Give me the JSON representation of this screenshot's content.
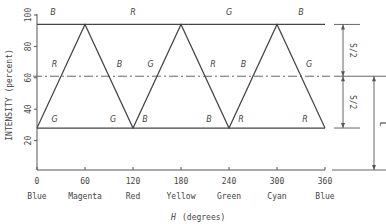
{
  "chart_data": {
    "type": "line",
    "title": "",
    "xlabel_symbol": "H",
    "xlabel": "(degrees)",
    "ylabel": "INTENSITY (percent)",
    "xlim": [
      0,
      360
    ],
    "ylim": [
      0,
      100
    ],
    "x_ticks": [
      0,
      60,
      120,
      180,
      240,
      300,
      360
    ],
    "y_ticks": [
      20,
      40,
      60,
      80,
      100
    ],
    "x_tick_names": [
      "Blue",
      "Magenta",
      "Red",
      "Yellow",
      "Green",
      "Cyan",
      "Blue"
    ],
    "grid": false,
    "legend": "none (curves labeled inline with R, G, B)",
    "levels": {
      "max": 94,
      "mid": 61,
      "min": 28
    },
    "series": [
      {
        "name": "R",
        "x": [
          0,
          60,
          180,
          240,
          360
        ],
        "y": [
          28,
          94,
          94,
          28,
          28
        ]
      },
      {
        "name": "G",
        "x": [
          0,
          120,
          180,
          300,
          360
        ],
        "y": [
          28,
          28,
          94,
          94,
          28
        ]
      },
      {
        "name": "B",
        "x": [
          0,
          60,
          120,
          240,
          300,
          360
        ],
        "y": [
          94,
          94,
          28,
          28,
          94,
          94
        ]
      }
    ],
    "inline_curve_labels": [
      {
        "text": "B",
        "x": 20,
        "y": 100
      },
      {
        "text": "R",
        "x": 120,
        "y": 100
      },
      {
        "text": "G",
        "x": 240,
        "y": 100
      },
      {
        "text": "B",
        "x": 330,
        "y": 100
      },
      {
        "text": "R",
        "x": 22,
        "y": 67
      },
      {
        "text": "B",
        "x": 103,
        "y": 67
      },
      {
        "text": "G",
        "x": 142,
        "y": 67
      },
      {
        "text": "R",
        "x": 220,
        "y": 67
      },
      {
        "text": "B",
        "x": 258,
        "y": 67
      },
      {
        "text": "G",
        "x": 340,
        "y": 67
      },
      {
        "text": "G",
        "x": 22,
        "y": 32
      },
      {
        "text": "G",
        "x": 95,
        "y": 32
      },
      {
        "text": "B",
        "x": 135,
        "y": 32
      },
      {
        "text": "B",
        "x": 215,
        "y": 32
      },
      {
        "text": "R",
        "x": 255,
        "y": 32
      },
      {
        "text": "R",
        "x": 335,
        "y": 32
      }
    ],
    "dimension_annotations": [
      {
        "label": "S/2",
        "from": 94,
        "to": 61
      },
      {
        "label": "S/2",
        "from": 61,
        "to": 28
      },
      {
        "label": "L",
        "from": 61,
        "to": 0
      }
    ]
  }
}
